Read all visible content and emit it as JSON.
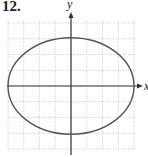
{
  "problem_number": "12.",
  "axes": {
    "x_label": "x",
    "y_label": "y"
  },
  "colors": {
    "grid": "#b5b5b5",
    "axis": "#333333",
    "curve": "#555555"
  },
  "chart_data": {
    "type": "line",
    "title": "12.",
    "xlabel": "x",
    "ylabel": "y",
    "equation": "x^2/16 + y^2/9 = 1",
    "center": [
      0,
      0
    ],
    "semi_axis_x": 4,
    "semi_axis_y": 3,
    "xlim": [
      -4,
      4
    ],
    "ylim": [
      -4,
      4
    ],
    "grid": true,
    "tick_labels": false,
    "key_points": [
      [
        4,
        0
      ],
      [
        0,
        3
      ],
      [
        -4,
        0
      ],
      [
        0,
        -3
      ]
    ]
  }
}
